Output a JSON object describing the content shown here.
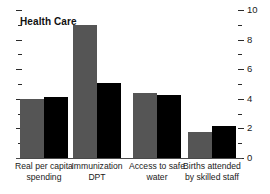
{
  "chart_data": {
    "type": "bar",
    "title": "Health Care",
    "xlabel": "",
    "ylabel": "",
    "ylim": [
      0,
      10
    ],
    "yticks": [
      0,
      2,
      4,
      6,
      8,
      10
    ],
    "ytick_labels": [
      "0",
      "2",
      "4",
      "6",
      "8",
      "10"
    ],
    "minor_yticks": [
      1,
      3,
      5,
      7,
      9
    ],
    "grid": false,
    "legend": "none",
    "axis_position": "right",
    "categories": [
      "Real per capita\nspending",
      "Immunization\nDPT",
      "Access to safe\nwater",
      "Births attended\nby skilled staff"
    ],
    "series": [
      {
        "name": "series-a",
        "color": "#555555",
        "values": [
          4.0,
          9.0,
          4.4,
          1.75
        ]
      },
      {
        "name": "series-b",
        "color": "#000000",
        "values": [
          4.15,
          5.05,
          4.25,
          2.15
        ]
      }
    ]
  }
}
